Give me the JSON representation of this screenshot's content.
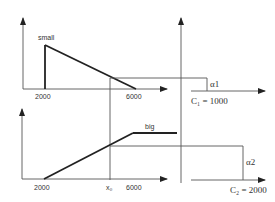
{
  "diagram": {
    "upper_chart": {
      "curve_label": "small",
      "x_tick_start": "2000",
      "x_tick_end": "6000"
    },
    "lower_chart": {
      "curve_label": "big",
      "x_tick_start": "2000",
      "x_marker": "x₀",
      "x_tick_end": "6000"
    },
    "right_upper": {
      "alpha_label": "α1",
      "cost_label": "C₁ = 1000"
    },
    "right_lower": {
      "alpha_label": "α2",
      "cost_label": "C₂ = 2000"
    }
  }
}
